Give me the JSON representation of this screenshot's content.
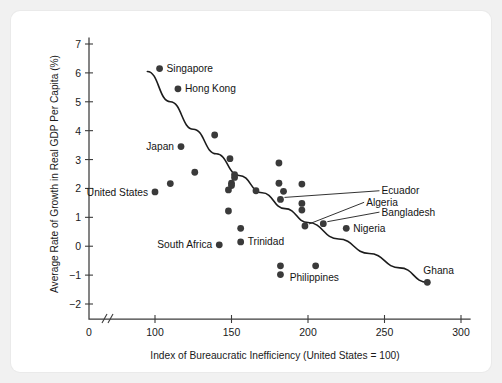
{
  "chart_data": {
    "type": "scatter",
    "title": "",
    "xlabel": "Index of Bureaucratic Inefficiency (United States = 100)",
    "ylabel": "Average Rate of Growth in Real GDP Per Capita (%)",
    "xlim": [
      88,
      305
    ],
    "ylim": [
      -2,
      7
    ],
    "x_ticks": [
      0,
      100,
      150,
      200,
      250,
      300
    ],
    "y_ticks": [
      7,
      6,
      5,
      4,
      3,
      2,
      1,
      0,
      -1,
      -2
    ],
    "x_tick_labels": [
      "0",
      "100",
      "150",
      "200",
      "250",
      "300"
    ],
    "y_tick_labels": [
      "7",
      "6",
      "5",
      "4",
      "3",
      "2",
      "1",
      "0",
      "−1",
      "−2"
    ],
    "axis_break": true,
    "grid": false,
    "legend": null,
    "points": [
      {
        "label": "Singapore",
        "x": 103,
        "y": 6.15,
        "label_pos": "right"
      },
      {
        "label": "Hong Kong",
        "x": 115,
        "y": 5.45,
        "label_pos": "right"
      },
      {
        "label": "Japan",
        "x": 117,
        "y": 3.45,
        "label_pos": "left"
      },
      {
        "label": "United States",
        "x": 100,
        "y": 1.88,
        "label_pos": "left"
      },
      {
        "label": "South Africa",
        "x": 142,
        "y": 0.05,
        "label_pos": "left"
      },
      {
        "label": "Trinidad",
        "x": 156,
        "y": 0.15,
        "label_pos": "right"
      },
      {
        "label": "Ecuador",
        "x": 182,
        "y": 1.62,
        "label_pos": "leader",
        "leader_x": 248,
        "leader_y": 1.92
      },
      {
        "label": "Algeria",
        "x": 198,
        "y": 0.7,
        "label_pos": "leader",
        "leader_x": 238,
        "leader_y": 1.52
      },
      {
        "label": "Bangladesh",
        "x": 210,
        "y": 0.78,
        "label_pos": "leader",
        "leader_x": 248,
        "leader_y": 1.18
      },
      {
        "label": "Nigeria",
        "x": 225,
        "y": 0.62,
        "label_pos": "right"
      },
      {
        "label": "Philippines",
        "x": 205,
        "y": -0.68,
        "label_pos": "below"
      },
      {
        "label": "Ghana",
        "x": 278,
        "y": -1.25,
        "label_pos": "above-right"
      },
      {
        "label": "",
        "x": 110,
        "y": 2.17
      },
      {
        "label": "",
        "x": 126,
        "y": 2.56
      },
      {
        "label": "",
        "x": 139,
        "y": 3.85
      },
      {
        "label": "",
        "x": 149,
        "y": 3.03
      },
      {
        "label": "",
        "x": 152,
        "y": 2.48
      },
      {
        "label": "",
        "x": 152,
        "y": 2.38
      },
      {
        "label": "",
        "x": 150,
        "y": 2.18
      },
      {
        "label": "",
        "x": 150,
        "y": 2.1
      },
      {
        "label": "",
        "x": 148,
        "y": 1.95
      },
      {
        "label": "",
        "x": 148,
        "y": 1.22
      },
      {
        "label": "",
        "x": 156,
        "y": 0.62
      },
      {
        "label": "",
        "x": 166,
        "y": 1.92
      },
      {
        "label": "",
        "x": 181,
        "y": 2.88
      },
      {
        "label": "",
        "x": 181,
        "y": 2.18
      },
      {
        "label": "",
        "x": 184,
        "y": 1.9
      },
      {
        "label": "",
        "x": 196,
        "y": 2.15
      },
      {
        "label": "",
        "x": 196,
        "y": 1.48
      },
      {
        "label": "",
        "x": 196,
        "y": 1.25
      },
      {
        "label": "",
        "x": 182,
        "y": -0.68
      },
      {
        "label": "",
        "x": 182,
        "y": -0.98
      }
    ],
    "trend_curve": {
      "description": "Downward sloping fitted curve from upper-left to lower-right",
      "points": [
        {
          "x": 95,
          "y": 6.05
        },
        {
          "x": 110,
          "y": 5.0
        },
        {
          "x": 125,
          "y": 4.05
        },
        {
          "x": 140,
          "y": 3.2
        },
        {
          "x": 155,
          "y": 2.45
        },
        {
          "x": 170,
          "y": 1.85
        },
        {
          "x": 185,
          "y": 1.3
        },
        {
          "x": 200,
          "y": 0.82
        },
        {
          "x": 220,
          "y": 0.25
        },
        {
          "x": 240,
          "y": -0.25
        },
        {
          "x": 260,
          "y": -0.75
        },
        {
          "x": 278,
          "y": -1.25
        }
      ]
    }
  }
}
